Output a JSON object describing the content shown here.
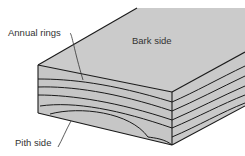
{
  "diagram": {
    "labels": {
      "annual_rings": "Annual rings",
      "bark_side": "Bark side",
      "pith_side": "Pith side"
    },
    "colors": {
      "face_fill": "#c8c8c8",
      "top_fill": "#cbcbcb",
      "line": "#1a1a1a",
      "text": "#333333",
      "background": "#ffffff"
    }
  }
}
